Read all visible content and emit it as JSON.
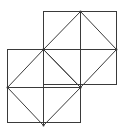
{
  "diagram": {
    "title": "",
    "width": 119,
    "height": 130,
    "stroke_color": "#3a3a3a",
    "stroke_width": 1,
    "background": "#ffffff",
    "squares": [
      {
        "name": "upper-right-square",
        "x": 43,
        "y": 11,
        "size": 73,
        "center": [
          80,
          49
        ],
        "midpoints": {
          "top": [
            80,
            11
          ],
          "right": [
            116,
            49
          ],
          "bottom": [
            80,
            87
          ],
          "left": [
            43,
            49
          ]
        }
      },
      {
        "name": "lower-left-square",
        "x": 7,
        "y": 49,
        "size": 73,
        "center": [
          43,
          87
        ],
        "midpoints": {
          "top": [
            43,
            49
          ],
          "right": [
            80,
            87
          ],
          "bottom": [
            43,
            125
          ],
          "left": [
            7,
            87
          ]
        }
      }
    ]
  }
}
